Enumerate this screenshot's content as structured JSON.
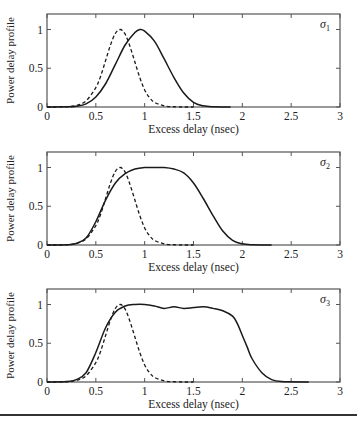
{
  "chart_data": [
    {
      "type": "line",
      "panel_label": "σ1",
      "title": "",
      "xlabel": "Excess delay (nsec)",
      "ylabel": "Power delay profile",
      "xlim": [
        0,
        3
      ],
      "ylim": [
        0,
        1.2
      ],
      "xticks": [
        "0",
        "0.5",
        "1",
        "1.5",
        "2",
        "2.5",
        "3"
      ],
      "yticks": [
        "0",
        "0.5",
        "1"
      ],
      "grid": false,
      "series": [
        {
          "name": "reference (dashed)",
          "style": "dashed",
          "x": [
            0,
            0.2,
            0.3,
            0.4,
            0.5,
            0.55,
            0.6,
            0.65,
            0.7,
            0.75,
            0.8,
            0.85,
            0.9,
            0.95,
            1.0,
            1.05,
            1.1,
            1.2,
            1.3,
            1.4,
            1.5
          ],
          "y": [
            0,
            0.003,
            0.02,
            0.08,
            0.25,
            0.4,
            0.6,
            0.8,
            0.95,
            1.0,
            0.94,
            0.78,
            0.58,
            0.38,
            0.22,
            0.12,
            0.06,
            0.015,
            0.003,
            0.0,
            0.0
          ]
        },
        {
          "name": "σ1 profile (solid)",
          "style": "solid",
          "x": [
            0,
            0.2,
            0.3,
            0.4,
            0.5,
            0.6,
            0.7,
            0.8,
            0.9,
            0.95,
            1.0,
            1.1,
            1.2,
            1.3,
            1.4,
            1.5,
            1.6,
            1.7,
            1.88
          ],
          "y": [
            0,
            0.002,
            0.01,
            0.04,
            0.13,
            0.3,
            0.55,
            0.8,
            0.96,
            1.0,
            0.98,
            0.85,
            0.62,
            0.38,
            0.18,
            0.06,
            0.015,
            0.003,
            0.0
          ]
        }
      ]
    },
    {
      "type": "line",
      "panel_label": "σ2",
      "title": "",
      "xlabel": "Excess delay (nsec)",
      "ylabel": "Power delay profile",
      "xlim": [
        0,
        3
      ],
      "ylim": [
        0,
        1.2
      ],
      "xticks": [
        "0",
        "0.5",
        "1",
        "1.5",
        "2",
        "2.5",
        "3"
      ],
      "yticks": [
        "0",
        "0.5",
        "1"
      ],
      "grid": false,
      "series": [
        {
          "name": "reference (dashed)",
          "style": "dashed",
          "x": [
            0,
            0.2,
            0.3,
            0.4,
            0.5,
            0.55,
            0.6,
            0.65,
            0.7,
            0.75,
            0.8,
            0.85,
            0.9,
            0.95,
            1.0,
            1.05,
            1.1,
            1.2,
            1.3,
            1.4,
            1.5
          ],
          "y": [
            0,
            0.003,
            0.02,
            0.08,
            0.25,
            0.4,
            0.6,
            0.8,
            0.95,
            1.0,
            0.94,
            0.78,
            0.58,
            0.38,
            0.22,
            0.12,
            0.06,
            0.015,
            0.003,
            0.0,
            0.0
          ]
        },
        {
          "name": "σ2 profile (solid)",
          "style": "solid",
          "x": [
            0,
            0.2,
            0.3,
            0.4,
            0.5,
            0.6,
            0.7,
            0.8,
            0.9,
            1.0,
            1.1,
            1.2,
            1.3,
            1.4,
            1.5,
            1.6,
            1.7,
            1.8,
            1.9,
            2.0,
            2.1,
            2.3
          ],
          "y": [
            0,
            0.003,
            0.02,
            0.09,
            0.3,
            0.58,
            0.8,
            0.92,
            0.98,
            1.0,
            1.0,
            1.0,
            0.98,
            0.93,
            0.8,
            0.6,
            0.38,
            0.18,
            0.06,
            0.015,
            0.003,
            0.0
          ]
        }
      ]
    },
    {
      "type": "line",
      "panel_label": "σ3",
      "title": "",
      "xlabel": "Excess delay (nsec)",
      "ylabel": "Power delay profile",
      "xlim": [
        0,
        3
      ],
      "ylim": [
        0,
        1.2
      ],
      "xticks": [
        "0",
        "0.5",
        "1",
        "1.5",
        "2",
        "2.5",
        "3"
      ],
      "yticks": [
        "0",
        "0.5",
        "1"
      ],
      "grid": false,
      "series": [
        {
          "name": "reference (dashed)",
          "style": "dashed",
          "x": [
            0,
            0.2,
            0.3,
            0.4,
            0.5,
            0.55,
            0.6,
            0.65,
            0.7,
            0.75,
            0.8,
            0.85,
            0.9,
            0.95,
            1.0,
            1.05,
            1.1,
            1.2,
            1.3,
            1.4,
            1.5
          ],
          "y": [
            0,
            0.003,
            0.02,
            0.08,
            0.25,
            0.4,
            0.6,
            0.8,
            0.95,
            1.0,
            0.94,
            0.78,
            0.58,
            0.38,
            0.22,
            0.12,
            0.06,
            0.015,
            0.003,
            0.0,
            0.0
          ]
        },
        {
          "name": "σ3 profile (solid)",
          "style": "solid",
          "x": [
            0,
            0.2,
            0.3,
            0.4,
            0.5,
            0.6,
            0.7,
            0.8,
            0.9,
            1.0,
            1.1,
            1.2,
            1.3,
            1.4,
            1.5,
            1.6,
            1.7,
            1.8,
            1.9,
            1.95,
            2.0,
            2.05,
            2.1,
            2.2,
            2.3,
            2.4,
            2.68
          ],
          "y": [
            0,
            0.005,
            0.03,
            0.12,
            0.38,
            0.7,
            0.9,
            0.98,
            1.0,
            1.0,
            0.98,
            0.95,
            0.97,
            0.95,
            0.96,
            0.97,
            0.95,
            0.92,
            0.85,
            0.75,
            0.6,
            0.45,
            0.3,
            0.12,
            0.03,
            0.005,
            0.0
          ]
        }
      ]
    }
  ],
  "panels": [
    {
      "label_main": "σ",
      "label_sub": "1",
      "ylabel": "Power delay profile",
      "xlabel": "Excess delay (nsec)"
    },
    {
      "label_main": "σ",
      "label_sub": "2",
      "ylabel": "Power delay profile",
      "xlabel": "Excess delay (nsec)"
    },
    {
      "label_main": "σ",
      "label_sub": "3",
      "ylabel": "Power delay profile",
      "xlabel": "Excess delay (nsec)"
    }
  ],
  "style": {
    "axis_color": "#555555",
    "line_color": "#1a1a1a",
    "text_color": "#222222"
  }
}
